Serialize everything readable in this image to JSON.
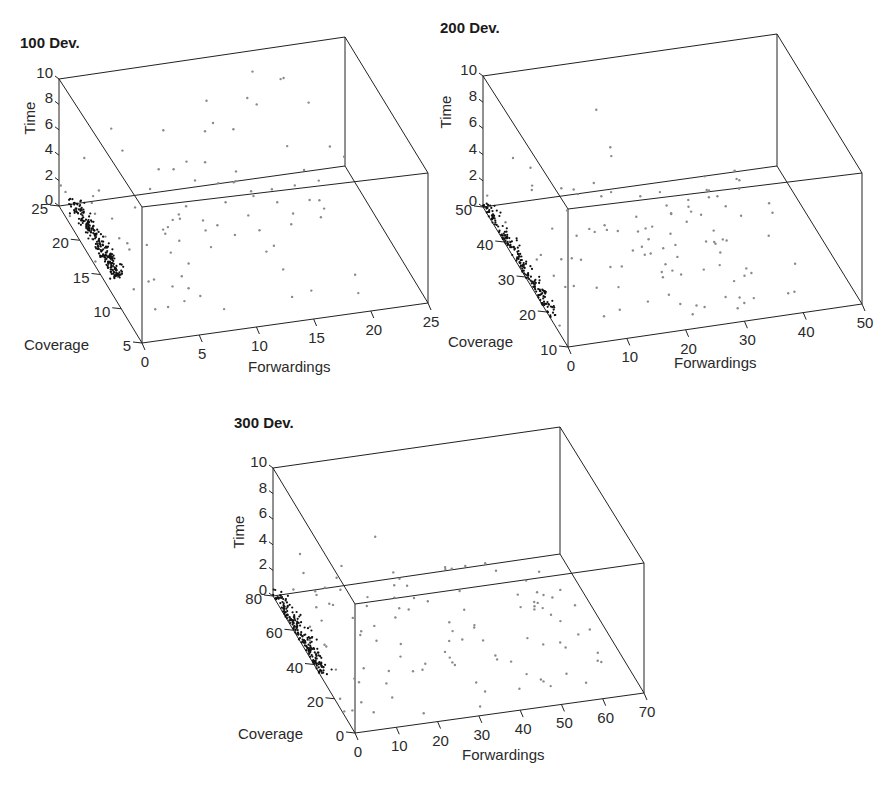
{
  "figure": {
    "width": 888,
    "height": 789
  },
  "chart_data": [
    {
      "type": "scatter",
      "projection": "3d",
      "title": "100 Dev.",
      "xlabel": "Forwardings",
      "ylabel": "Coverage",
      "zlabel": "Time",
      "xlim": [
        0,
        25
      ],
      "ylim": [
        5,
        25
      ],
      "zlim": [
        0,
        10
      ],
      "xticks": [
        "0",
        "5",
        "10",
        "15",
        "20",
        "25"
      ],
      "yticks": [
        "5",
        "10",
        "15",
        "20",
        "25"
      ],
      "zticks": [
        "0",
        "2",
        "4",
        "6",
        "8",
        "10"
      ],
      "grid": false,
      "series": [
        {
          "name": "grey",
          "color": "#8a8a8a",
          "description": "scattered points spread over forwardings 0-22, times 0-8"
        },
        {
          "name": "black",
          "color": "#111111",
          "description": "dense cluster near forwardings ~1-2, time ~0, coverage ~14-25"
        }
      ],
      "layout": {
        "title_pos": [
          20,
          48
        ],
        "box": {
          "back_top_left": [
            59,
            79
          ],
          "back_top_right": [
            345,
            37
          ],
          "back_bottom_left": [
            59,
            206
          ],
          "back_bottom_right": [
            345,
            166
          ],
          "front_top_left": [
            142,
            207
          ],
          "front_top_right": [
            428,
            173
          ],
          "front_bottom_left": [
            142,
            343
          ],
          "front_bottom_right": [
            428,
            303
          ]
        }
      }
    },
    {
      "type": "scatter",
      "projection": "3d",
      "title": "200 Dev.",
      "xlabel": "Forwardings",
      "ylabel": "Coverage",
      "zlabel": "Time",
      "xlim": [
        0,
        50
      ],
      "ylim": [
        10,
        50
      ],
      "zlim": [
        0,
        10
      ],
      "xticks": [
        "0",
        "10",
        "20",
        "30",
        "40",
        "50"
      ],
      "yticks": [
        "10",
        "20",
        "30",
        "40",
        "50"
      ],
      "zticks": [
        "0",
        "2",
        "4",
        "6",
        "8",
        "10"
      ],
      "grid": false,
      "series": [
        {
          "name": "grey",
          "color": "#8a8a8a",
          "description": "scattered points spread over forwardings 0-45, times 0-8"
        },
        {
          "name": "black",
          "color": "#111111",
          "description": "dense vertical cluster near forwardings ~0-1, time ~0, coverage ~18-50"
        }
      ],
      "layout": {
        "title_pos": [
          440,
          33
        ],
        "box": {
          "back_top_left": [
            483,
            76
          ],
          "back_top_right": [
            777,
            34
          ],
          "back_bottom_left": [
            483,
            207
          ],
          "back_bottom_right": [
            777,
            166
          ],
          "front_top_left": [
            568,
            209
          ],
          "front_top_right": [
            862,
            173
          ],
          "front_bottom_left": [
            568,
            347
          ],
          "front_bottom_right": [
            862,
            304
          ]
        }
      }
    },
    {
      "type": "scatter",
      "projection": "3d",
      "title": "300 Dev.",
      "xlabel": "Forwardings",
      "ylabel": "Coverage",
      "zlabel": "Time",
      "xlim": [
        0,
        70
      ],
      "ylim": [
        0,
        80
      ],
      "zlim": [
        0,
        10
      ],
      "xticks": [
        "0",
        "10",
        "20",
        "30",
        "40",
        "50",
        "60",
        "70"
      ],
      "yticks": [
        "0",
        "20",
        "40",
        "60",
        "80"
      ],
      "zticks": [
        "0",
        "2",
        "4",
        "6",
        "8",
        "10"
      ],
      "grid": false,
      "series": [
        {
          "name": "grey",
          "color": "#8a8a8a",
          "description": "scattered points spread over forwardings 0-65, times 0-8"
        },
        {
          "name": "black",
          "color": "#111111",
          "description": "dense vertical cluster near forwardings ~0, time ~0, coverage ~35-80"
        }
      ],
      "layout": {
        "title_pos": [
          234,
          428
        ],
        "box": {
          "back_top_left": [
            273,
            468
          ],
          "back_top_right": [
            560,
            427
          ],
          "back_bottom_left": [
            273,
            596
          ],
          "back_bottom_right": [
            560,
            554
          ],
          "front_top_left": [
            355,
            604
          ],
          "front_top_right": [
            644,
            563
          ],
          "front_bottom_left": [
            355,
            733
          ],
          "front_bottom_right": [
            644,
            693
          ]
        }
      }
    }
  ]
}
